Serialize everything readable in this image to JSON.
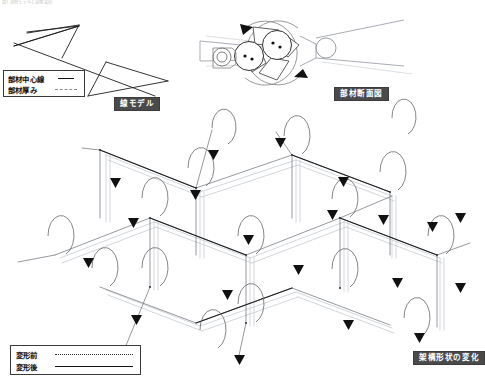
{
  "page": {
    "width": 480,
    "height": 381,
    "background": "#ffffff",
    "scan_header_text": "図1  部材モデルと架構変形"
  },
  "panels": {
    "line_model": {
      "caption": "線モデル",
      "legend": {
        "rows": [
          {
            "label": "部材中心線",
            "style": "solid",
            "icon": "solid-line-icon"
          },
          {
            "label": "部材厚み",
            "style": "dashed",
            "icon": "dashed-line-icon"
          }
        ]
      }
    },
    "member_section": {
      "caption": "部材断面図",
      "annotations": {
        "rotation_icon": "rotation-arrow-icon",
        "pin_icon": "pin-dot-icon"
      }
    },
    "frame_change": {
      "caption": "架構形状の変化",
      "legend": {
        "rows": [
          {
            "label": "変形前",
            "style": "dotted",
            "icon": "dotted-line-icon"
          },
          {
            "label": "変形後",
            "style": "solid",
            "icon": "solid-line-icon"
          }
        ]
      }
    }
  },
  "colors": {
    "ink": "#111111",
    "member_before": "#b8bcc4",
    "member_after": "#6e7480",
    "arrow": "#111111",
    "tag_background": "#4a4a4a",
    "tag_text": "#ffffff",
    "rule": "#3a3a3a"
  }
}
